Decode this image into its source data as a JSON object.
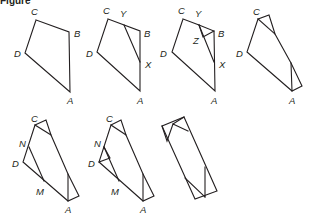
{
  "title": "Figure",
  "stroke_color": "#231f20",
  "background": "#ffffff",
  "figures": [
    {
      "id": "step-1",
      "description": "Quadrilateral ABCD",
      "polylines": [
        [
          [
            36,
            20
          ],
          [
            69,
            32
          ],
          [
            70,
            92
          ],
          [
            25,
            53
          ],
          [
            36,
            20
          ]
        ]
      ],
      "labels": [
        {
          "text": "C",
          "x": 31,
          "y": 15
        },
        {
          "text": "B",
          "x": 74,
          "y": 37
        },
        {
          "text": "D",
          "x": 14,
          "y": 57
        },
        {
          "text": "A",
          "x": 67,
          "y": 104
        }
      ]
    },
    {
      "id": "step-2",
      "description": "Fold line XY drawn across corner B",
      "polylines": [
        [
          [
            108,
            19
          ],
          [
            140,
            31
          ],
          [
            140,
            91
          ],
          [
            97,
            52
          ],
          [
            108,
            19
          ]
        ],
        [
          [
            124,
            25
          ],
          [
            140,
            62
          ]
        ]
      ],
      "labels": [
        {
          "text": "C",
          "x": 103,
          "y": 14
        },
        {
          "text": "Y",
          "x": 120,
          "y": 17
        },
        {
          "text": "B",
          "x": 144,
          "y": 37
        },
        {
          "text": "D",
          "x": 86,
          "y": 57
        },
        {
          "text": "X",
          "x": 145,
          "y": 68
        },
        {
          "text": "A",
          "x": 137,
          "y": 104
        }
      ]
    },
    {
      "id": "step-3",
      "description": "Corner B folded over XY to point Z",
      "polylines": [
        [
          [
            183,
            19
          ],
          [
            199,
            25
          ],
          [
            214,
            31
          ],
          [
            215,
            91
          ],
          [
            172,
            52
          ],
          [
            183,
            19
          ]
        ],
        [
          [
            199,
            25
          ],
          [
            214,
            62
          ]
        ],
        [
          [
            199,
            25
          ],
          [
            203,
            37
          ],
          [
            214,
            31
          ]
        ]
      ],
      "labels": [
        {
          "text": "C",
          "x": 178,
          "y": 14
        },
        {
          "text": "Y",
          "x": 195,
          "y": 17
        },
        {
          "text": "Z",
          "x": 193,
          "y": 44
        },
        {
          "text": "B",
          "x": 218,
          "y": 37
        },
        {
          "text": "D",
          "x": 160,
          "y": 57
        },
        {
          "text": "X",
          "x": 219,
          "y": 68
        },
        {
          "text": "A",
          "x": 211,
          "y": 104
        }
      ]
    },
    {
      "id": "step-4",
      "description": "Corners C and A folded along the same line",
      "polylines": [
        [
          [
            258,
            19
          ],
          [
            269,
            15
          ],
          [
            275,
            34
          ],
          [
            291,
            63
          ],
          [
            302,
            86
          ],
          [
            292,
            91
          ],
          [
            247,
            52
          ],
          [
            258,
            19
          ]
        ],
        [
          [
            258,
            19
          ],
          [
            275,
            34
          ]
        ],
        [
          [
            291,
            63
          ],
          [
            292,
            91
          ]
        ]
      ],
      "labels": [
        {
          "text": "C",
          "x": 253,
          "y": 15
        },
        {
          "text": "D",
          "x": 236,
          "y": 57
        },
        {
          "text": "A",
          "x": 289,
          "y": 104
        }
      ]
    },
    {
      "id": "step-5",
      "description": "Fold line NM drawn across corner D",
      "polylines": [
        [
          [
            35,
            125
          ],
          [
            46,
            120
          ],
          [
            51,
            135
          ],
          [
            68,
            174
          ],
          [
            79,
            196
          ],
          [
            68,
            201
          ],
          [
            23,
            162
          ],
          [
            35,
            125
          ]
        ],
        [
          [
            35,
            125
          ],
          [
            51,
            135
          ]
        ],
        [
          [
            68,
            174
          ],
          [
            68,
            201
          ]
        ],
        [
          [
            29,
            147
          ],
          [
            44,
            181
          ]
        ]
      ],
      "labels": [
        {
          "text": "C",
          "x": 31,
          "y": 122
        },
        {
          "text": "N",
          "x": 19,
          "y": 147
        },
        {
          "text": "D",
          "x": 12,
          "y": 167
        },
        {
          "text": "M",
          "x": 36,
          "y": 195
        },
        {
          "text": "A",
          "x": 65,
          "y": 213
        }
      ]
    },
    {
      "id": "step-6",
      "description": "Corner D folded over NM",
      "polylines": [
        [
          [
            111,
            125
          ],
          [
            121,
            120
          ],
          [
            126,
            135
          ],
          [
            143,
            174
          ],
          [
            154,
            196
          ],
          [
            143,
            201
          ],
          [
            99,
            162
          ],
          [
            111,
            125
          ]
        ],
        [
          [
            111,
            125
          ],
          [
            126,
            135
          ]
        ],
        [
          [
            143,
            174
          ],
          [
            143,
            201
          ]
        ],
        [
          [
            104,
            147
          ],
          [
            119,
            181
          ]
        ],
        [
          [
            99,
            162
          ],
          [
            110,
            158
          ],
          [
            104,
            147
          ]
        ]
      ],
      "labels": [
        {
          "text": "C",
          "x": 106,
          "y": 122
        },
        {
          "text": "N",
          "x": 94,
          "y": 147
        },
        {
          "text": "D",
          "x": 88,
          "y": 167
        },
        {
          "text": "M",
          "x": 111,
          "y": 195
        },
        {
          "text": "A",
          "x": 140,
          "y": 213
        }
      ]
    },
    {
      "id": "step-7",
      "description": "Completed fold forms a rectangle",
      "polylines": [
        [
          [
            162,
            126
          ],
          [
            184,
            117
          ],
          [
            217,
            191
          ],
          [
            195,
            199
          ],
          [
            162,
            126
          ]
        ],
        [
          [
            162,
            126
          ],
          [
            167,
            141
          ],
          [
            173,
            124
          ],
          [
            188,
            131
          ]
        ],
        [
          [
            173,
            124
          ],
          [
            184,
            117
          ]
        ],
        [
          [
            185,
            178
          ],
          [
            205,
            197
          ]
        ],
        [
          [
            205,
            167
          ],
          [
            205,
            197
          ]
        ]
      ],
      "labels": []
    }
  ]
}
